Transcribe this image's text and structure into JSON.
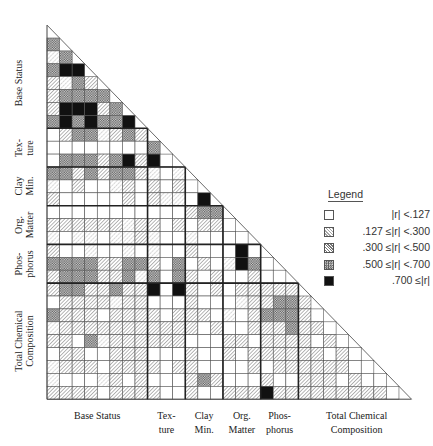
{
  "chart_data": {
    "type": "heatmap",
    "title": "",
    "subtitle": "",
    "variable_groups": [
      {
        "name": "Base Status",
        "label": "Base Status",
        "count": 8
      },
      {
        "name": "Texture",
        "label": "Tex-\nture",
        "count": 3
      },
      {
        "name": "Clay Min.",
        "label": "Clay\nMin.",
        "count": 3
      },
      {
        "name": "Org. Matter",
        "label": "Org.\nMatter",
        "count": 3
      },
      {
        "name": "Phosphorus",
        "label": "Phos-\nphorus",
        "count": 3
      },
      {
        "name": "Total Chemical Composition",
        "label": "Total Chemical\nComposition",
        "count": 9
      }
    ],
    "row_groups_visible": [
      {
        "label": "Base Status",
        "rows": 7
      },
      {
        "label": "Tex-\nture",
        "rows": 3
      },
      {
        "label": "Clay\nMin.",
        "rows": 3
      },
      {
        "label": "Org.\nMatter",
        "rows": 3
      },
      {
        "label": "Phos-\nphorus",
        "rows": 3
      },
      {
        "label": "Total Chemical\nComposition",
        "rows": 9
      }
    ],
    "column_groups_visible": [
      {
        "label": "Base Status",
        "cols": 8
      },
      {
        "label": "Tex-\nture",
        "cols": 3
      },
      {
        "label": "Clay\nMin.",
        "cols": 3
      },
      {
        "label": "Org.\nMatter",
        "cols": 3
      },
      {
        "label": "Phos-\nphorus",
        "cols": 3
      },
      {
        "label": "Total Chemical\nComposition",
        "cols": 8
      }
    ],
    "levels": [
      {
        "level": 0,
        "label": "|r| <.127",
        "pattern": "blank"
      },
      {
        "level": 1,
        "label": ".127 ≤|r| <.300",
        "pattern": "light-hatch"
      },
      {
        "level": 2,
        "label": ".300 ≤|r| <.500",
        "pattern": "hatch"
      },
      {
        "level": 3,
        "label": ".500 ≤|r| <.700",
        "pattern": "crosshatch"
      },
      {
        "level": 4,
        "label": ".700 ≤|r|",
        "pattern": "solid"
      }
    ],
    "matrix_levels": [
      [
        3
      ],
      [
        1,
        3
      ],
      [
        3,
        4,
        4
      ],
      [
        2,
        1,
        3,
        2
      ],
      [
        2,
        3,
        3,
        3,
        3
      ],
      [
        2,
        4,
        4,
        4,
        2,
        3
      ],
      [
        3,
        4,
        3,
        4,
        3,
        3,
        4
      ],
      [
        0,
        2,
        3,
        3,
        1,
        2,
        3,
        2
      ],
      [
        0,
        0,
        0,
        0,
        0,
        0,
        0,
        0,
        3
      ],
      [
        0,
        3,
        3,
        3,
        2,
        3,
        4,
        2,
        4,
        0
      ],
      [
        3,
        3,
        2,
        3,
        2,
        3,
        3,
        2,
        1,
        0,
        1
      ],
      [
        1,
        0,
        2,
        0,
        0,
        1,
        2,
        0,
        2,
        0,
        2,
        0
      ],
      [
        2,
        0,
        0,
        0,
        0,
        0,
        2,
        0,
        2,
        1,
        1,
        0,
        4
      ],
      [
        0,
        0,
        0,
        0,
        0,
        0,
        0,
        0,
        0,
        0,
        0,
        2,
        3,
        3
      ],
      [
        2,
        2,
        2,
        2,
        2,
        2,
        1,
        2,
        2,
        0,
        2,
        0,
        2,
        2,
        0
      ],
      [
        1,
        0,
        1,
        1,
        0,
        1,
        1,
        2,
        1,
        0,
        0,
        1,
        0,
        0,
        0,
        0
      ],
      [
        2,
        0,
        0,
        1,
        0,
        0,
        1,
        0,
        1,
        0,
        0,
        2,
        0,
        0,
        0,
        4,
        0
      ],
      [
        3,
        3,
        3,
        3,
        2,
        2,
        3,
        3,
        2,
        0,
        3,
        0,
        2,
        0,
        1,
        4,
        3,
        0
      ],
      [
        2,
        3,
        3,
        3,
        2,
        2,
        3,
        1,
        3,
        0,
        3,
        2,
        0,
        2,
        0,
        0,
        2,
        0,
        0
      ],
      [
        2,
        3,
        3,
        2,
        2,
        3,
        2,
        2,
        4,
        0,
        4,
        2,
        0,
        2,
        0,
        2,
        2,
        2,
        2,
        2
      ],
      [
        0,
        2,
        2,
        2,
        2,
        1,
        2,
        2,
        0,
        0,
        0,
        2,
        0,
        0,
        0,
        1,
        2,
        2,
        3,
        3,
        2
      ],
      [
        3,
        2,
        2,
        2,
        0,
        2,
        2,
        2,
        2,
        0,
        2,
        2,
        2,
        0,
        1,
        0,
        2,
        3,
        3,
        3,
        2,
        0
      ],
      [
        1,
        2,
        2,
        2,
        2,
        2,
        2,
        2,
        2,
        2,
        2,
        2,
        0,
        2,
        0,
        0,
        2,
        2,
        2,
        3,
        2,
        2,
        0
      ],
      [
        2,
        2,
        0,
        3,
        1,
        2,
        2,
        2,
        2,
        2,
        2,
        0,
        0,
        0,
        2,
        2,
        0,
        2,
        2,
        2,
        2,
        0,
        2,
        0
      ],
      [
        0,
        2,
        2,
        0,
        0,
        2,
        2,
        2,
        0,
        0,
        0,
        2,
        0,
        0,
        2,
        0,
        2,
        2,
        2,
        2,
        2,
        2,
        0,
        2,
        0
      ],
      [
        1,
        2,
        2,
        2,
        0,
        2,
        2,
        2,
        2,
        0,
        2,
        2,
        0,
        0,
        0,
        0,
        2,
        0,
        2,
        2,
        2,
        2,
        2,
        2,
        0,
        0
      ],
      [
        1,
        0,
        0,
        0,
        1,
        2,
        0,
        2,
        0,
        0,
        0,
        2,
        3,
        2,
        0,
        0,
        0,
        2,
        0,
        0,
        2,
        2,
        2,
        0,
        2,
        0,
        0
      ],
      [
        2,
        2,
        2,
        2,
        0,
        2,
        2,
        2,
        2,
        0,
        0,
        2,
        0,
        0,
        2,
        2,
        2,
        4,
        2,
        2,
        2,
        2,
        2,
        2,
        2,
        2,
        2,
        0
      ]
    ],
    "layout": {
      "grid_rows": 28,
      "grid_cols": 28,
      "legend_position": "right",
      "grid": true
    }
  },
  "legend": {
    "title": "Legend",
    "items": [
      {
        "label": "|r| <.127",
        "level": 0
      },
      {
        "label": ".127 ≤|r| <.300",
        "level": 1
      },
      {
        "label": ".300 ≤|r| <.500",
        "level": 2
      },
      {
        "label": ".500 ≤|r| <.700",
        "level": 3
      },
      {
        "label": ".700 ≤|r|",
        "level": 4
      }
    ]
  }
}
